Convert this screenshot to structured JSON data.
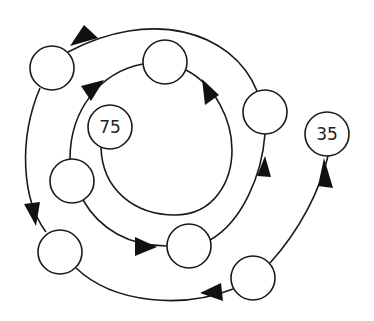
{
  "diagram": {
    "type": "number-sequence-spiral",
    "colors": {
      "stroke": "#1a1a1a",
      "arrow": "#111111",
      "background": "#ffffff"
    },
    "nodes": [
      {
        "id": "A",
        "label": "",
        "cx": 52,
        "cy": 68
      },
      {
        "id": "B",
        "label": "",
        "cx": 165,
        "cy": 62
      },
      {
        "id": "C",
        "label": "",
        "cx": 265,
        "cy": 112
      },
      {
        "id": "D",
        "label": "75",
        "cx": 110,
        "cy": 127
      },
      {
        "id": "E",
        "label": "",
        "cx": 72,
        "cy": 181
      },
      {
        "id": "F",
        "label": "",
        "cx": 60,
        "cy": 252
      },
      {
        "id": "G",
        "label": "",
        "cx": 189,
        "cy": 246
      },
      {
        "id": "H",
        "label": "",
        "cx": 253,
        "cy": 278
      },
      {
        "id": "I",
        "label": "35",
        "cx": 327,
        "cy": 134
      }
    ],
    "edges": [
      {
        "from": "H",
        "to": "I"
      },
      {
        "from": "H",
        "to": "F"
      },
      {
        "from": "A",
        "to": "F"
      },
      {
        "from": "C",
        "to": "A"
      },
      {
        "from": "G",
        "to": "C"
      },
      {
        "from": "E",
        "to": "G"
      },
      {
        "from": "E",
        "to": "B"
      },
      {
        "from": "D",
        "to": "B"
      }
    ]
  }
}
